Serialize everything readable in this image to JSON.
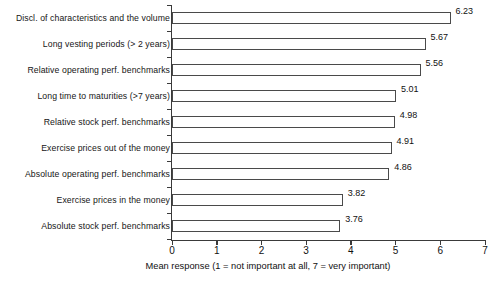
{
  "chart_data": {
    "type": "bar",
    "orientation": "horizontal",
    "title": "",
    "xlabel": "Mean response (1 = not important at all, 7 = very important)",
    "ylabel": "",
    "xlim": [
      0,
      7
    ],
    "xticks": [
      "0",
      "1",
      "2",
      "3",
      "4",
      "5",
      "6",
      "7"
    ],
    "grid": false,
    "legend": null,
    "bar_fill_color": "#ffffff",
    "bar_edge_color": "#4a4a4a",
    "axis_color": "#3a3a3a",
    "text_color": "#111111",
    "categories": [
      "Discl. of characteristics and the volume",
      "Long vesting periods (> 2 years)",
      "Relative operating perf. benchmarks",
      "Long time to maturities (>7 years)",
      "Relative stock perf. benchmarks",
      "Exercise prices out of the money",
      "Absolute operating perf. benchmarks",
      "Exercise prices in the money",
      "Absolute stock perf. benchmarks"
    ],
    "values": [
      6.23,
      5.67,
      5.56,
      5.01,
      4.98,
      4.91,
      4.86,
      3.82,
      3.76
    ],
    "value_labels": [
      "6.23",
      "5.67",
      "5.56",
      "5.01",
      "4.98",
      "4.91",
      "4.86",
      "3.82",
      "3.76"
    ]
  }
}
